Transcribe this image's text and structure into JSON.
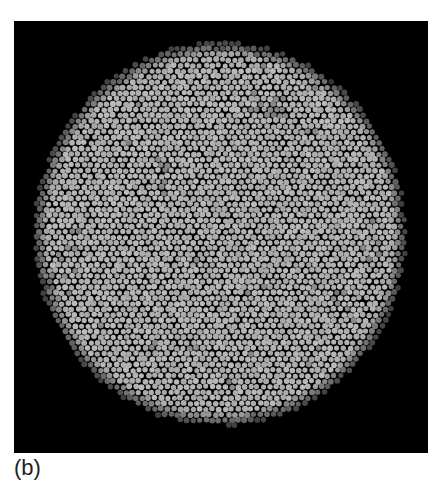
{
  "figure": {
    "panel_label": "(b)",
    "background_color": "#000000",
    "dot_bright_color": "#b5b5b5",
    "dot_dim_color": "#4a4a4a"
  },
  "mosaic": {
    "center_x": 206,
    "center_y": 213,
    "radius_x": 186,
    "radius_y": 192,
    "dot_spacing": 6.4,
    "dot_radius": 2.8,
    "bright_core": {
      "cx": 215,
      "cy": 185,
      "r": 85
    },
    "seed": 7
  }
}
